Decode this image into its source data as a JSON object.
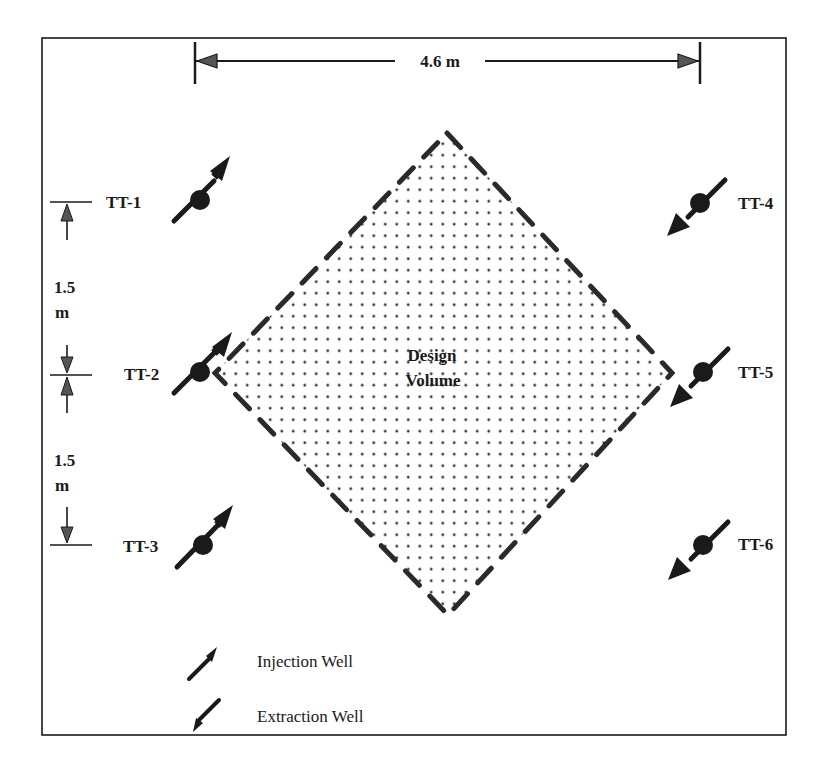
{
  "diagram": {
    "frame": {
      "x": 42,
      "y": 38,
      "width": 744,
      "height": 697
    },
    "colors": {
      "ink": "#1a1a1a",
      "background": "#ffffff",
      "dots": "#333333"
    },
    "horizontal_dimension": {
      "label": "4.6 m",
      "x1": 195,
      "x2": 700,
      "y": 60
    },
    "vertical_dimensions": [
      {
        "label_line1": "1.5",
        "label_line2": "m",
        "from_well": "TT-1",
        "to_well": "TT-2"
      },
      {
        "label_line1": "1.5",
        "label_line2": "m",
        "from_well": "TT-2",
        "to_well": "TT-3"
      }
    ],
    "design_volume": {
      "label_line1": "Design",
      "label_line2": "Volume",
      "shape": "diamond",
      "fill": "dotted",
      "border": "dashed",
      "vertices": {
        "top": [
          447,
          133
        ],
        "right": [
          672,
          373
        ],
        "bottom": [
          448,
          615
        ],
        "left": [
          215,
          373
        ]
      }
    },
    "wells": [
      {
        "id": "TT-1",
        "type": "injection",
        "x": 200,
        "y": 200,
        "label_side": "left"
      },
      {
        "id": "TT-2",
        "type": "injection",
        "x": 200,
        "y": 372,
        "label_side": "left"
      },
      {
        "id": "TT-3",
        "type": "injection",
        "x": 203,
        "y": 545,
        "label_side": "left"
      },
      {
        "id": "TT-4",
        "type": "extraction",
        "x": 700,
        "y": 203,
        "label_side": "right"
      },
      {
        "id": "TT-5",
        "type": "extraction",
        "x": 703,
        "y": 372,
        "label_side": "right"
      },
      {
        "id": "TT-6",
        "type": "extraction",
        "x": 703,
        "y": 545,
        "label_side": "right"
      }
    ],
    "legend": [
      {
        "type": "injection",
        "label": "Injection Well",
        "icon": "injection-arrow-icon"
      },
      {
        "type": "extraction",
        "label": "Extraction Well",
        "icon": "extraction-arrow-icon"
      }
    ]
  }
}
